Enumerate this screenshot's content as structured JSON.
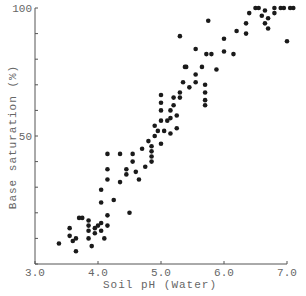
{
  "chart_data": {
    "type": "scatter",
    "title": "",
    "xlabel": "Soil pH (Water)",
    "ylabel": "Base saturation (%)",
    "xlim": [
      3.0,
      7.0
    ],
    "ylim": [
      0,
      100
    ],
    "xticks": [
      3.0,
      4.0,
      5.0,
      6.0,
      7.0
    ],
    "xtick_labels": [
      "3.0",
      "4.0",
      "5.0",
      "6.0",
      "7.0"
    ],
    "yticks": [
      0,
      10,
      20,
      30,
      40,
      50,
      60,
      70,
      80,
      90,
      100
    ],
    "ytick_labels": {
      "50": "50",
      "100": "100"
    },
    "grid": false,
    "legend": null,
    "marker_color": "#1a1a1a",
    "series": [
      {
        "name": "samples",
        "points": [
          [
            3.38,
            8
          ],
          [
            3.55,
            11
          ],
          [
            3.55,
            14
          ],
          [
            3.6,
            9
          ],
          [
            3.65,
            5
          ],
          [
            3.65,
            10
          ],
          [
            3.7,
            18
          ],
          [
            3.75,
            18
          ],
          [
            3.85,
            10
          ],
          [
            3.85,
            13
          ],
          [
            3.85,
            15
          ],
          [
            3.85,
            17
          ],
          [
            3.9,
            7
          ],
          [
            3.95,
            12
          ],
          [
            3.95,
            14
          ],
          [
            4.0,
            15
          ],
          [
            4.05,
            13
          ],
          [
            4.05,
            16
          ],
          [
            4.1,
            10
          ],
          [
            4.15,
            15
          ],
          [
            4.15,
            19
          ],
          [
            4.05,
            24
          ],
          [
            4.05,
            29
          ],
          [
            4.15,
            33
          ],
          [
            4.15,
            37
          ],
          [
            4.25,
            25
          ],
          [
            4.35,
            32
          ],
          [
            4.45,
            37
          ],
          [
            4.45,
            35
          ],
          [
            4.5,
            20
          ],
          [
            4.55,
            43
          ],
          [
            4.35,
            43
          ],
          [
            4.15,
            43
          ],
          [
            4.55,
            40
          ],
          [
            4.6,
            36
          ],
          [
            4.65,
            33
          ],
          [
            4.7,
            45
          ],
          [
            4.75,
            38
          ],
          [
            4.8,
            48
          ],
          [
            4.85,
            40
          ],
          [
            4.85,
            42
          ],
          [
            4.85,
            44
          ],
          [
            4.85,
            46
          ],
          [
            4.9,
            50
          ],
          [
            4.9,
            54
          ],
          [
            4.95,
            52
          ],
          [
            5.0,
            47
          ],
          [
            5.0,
            56
          ],
          [
            5.0,
            60
          ],
          [
            5.0,
            63
          ],
          [
            5.0,
            66
          ],
          [
            5.05,
            52
          ],
          [
            5.1,
            56
          ],
          [
            5.15,
            51
          ],
          [
            5.15,
            57
          ],
          [
            5.15,
            60
          ],
          [
            5.2,
            62
          ],
          [
            5.2,
            65
          ],
          [
            5.25,
            53
          ],
          [
            5.25,
            58
          ],
          [
            5.3,
            65
          ],
          [
            5.3,
            67
          ],
          [
            5.35,
            71
          ],
          [
            5.38,
            77
          ],
          [
            5.4,
            77
          ],
          [
            5.45,
            69
          ],
          [
            5.55,
            71
          ],
          [
            5.55,
            74
          ],
          [
            5.65,
            77
          ],
          [
            5.7,
            62
          ],
          [
            5.7,
            64
          ],
          [
            5.7,
            67
          ],
          [
            5.7,
            70
          ],
          [
            5.72,
            82
          ],
          [
            5.8,
            82
          ],
          [
            5.75,
            95
          ],
          [
            5.55,
            84
          ],
          [
            5.3,
            89
          ],
          [
            5.88,
            76
          ],
          [
            6.0,
            88
          ],
          [
            6.0,
            83
          ],
          [
            6.15,
            82
          ],
          [
            6.2,
            91
          ],
          [
            6.35,
            90
          ],
          [
            6.35,
            94
          ],
          [
            6.4,
            98
          ],
          [
            6.5,
            100
          ],
          [
            6.55,
            100
          ],
          [
            6.6,
            97
          ],
          [
            6.65,
            99
          ],
          [
            6.65,
            94
          ],
          [
            6.7,
            96
          ],
          [
            6.7,
            92
          ],
          [
            6.8,
            100
          ],
          [
            6.8,
            98
          ],
          [
            6.9,
            100
          ],
          [
            6.95,
            100
          ],
          [
            7.0,
            87
          ],
          [
            7.05,
            100
          ],
          [
            7.1,
            100
          ]
        ]
      }
    ]
  }
}
